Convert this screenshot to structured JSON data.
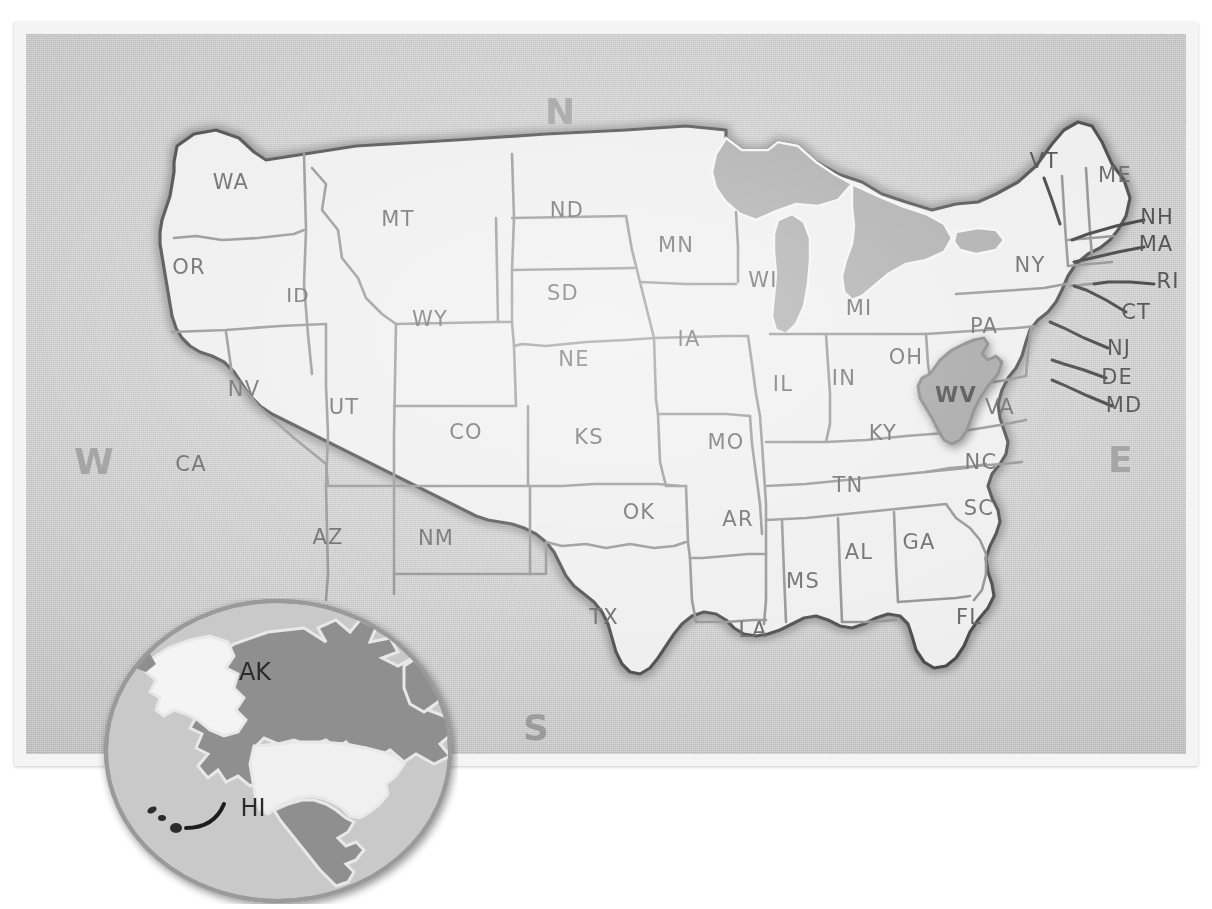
{
  "map": {
    "title": "United States map with West Virginia highlighted",
    "style": "hand-drawn poster on noisy gray board",
    "colors": {
      "board": "#c0c0c0",
      "frame": "#f4f4f4",
      "land_fill": "#ebebeb",
      "highlight_fill": "#8f8f8f",
      "water_fill": "#9a9a9a",
      "state_border": "#7d7d7d",
      "country_outline": "#2b2b2b",
      "label_text": "#4a4a4a",
      "compass_text": "#8d8d8d"
    },
    "highlighted_state": "WV"
  },
  "compass": {
    "north": "N",
    "south": "S",
    "east": "E",
    "west": "W"
  },
  "states": [
    {
      "code": "WA",
      "x": 205,
      "y": 155,
      "size": 21
    },
    {
      "code": "OR",
      "x": 163,
      "y": 240,
      "size": 21
    },
    {
      "code": "ID",
      "x": 272,
      "y": 268,
      "size": 20
    },
    {
      "code": "MT",
      "x": 372,
      "y": 192,
      "size": 21
    },
    {
      "code": "WY",
      "x": 404,
      "y": 292,
      "size": 21
    },
    {
      "code": "NV",
      "x": 218,
      "y": 362,
      "size": 21
    },
    {
      "code": "UT",
      "x": 318,
      "y": 380,
      "size": 21
    },
    {
      "code": "CA",
      "x": 165,
      "y": 437,
      "size": 21
    },
    {
      "code": "AZ",
      "x": 302,
      "y": 510,
      "size": 21
    },
    {
      "code": "NM",
      "x": 410,
      "y": 511,
      "size": 21
    },
    {
      "code": "CO",
      "x": 440,
      "y": 405,
      "size": 21
    },
    {
      "code": "ND",
      "x": 541,
      "y": 183,
      "size": 21
    },
    {
      "code": "SD",
      "x": 537,
      "y": 266,
      "size": 21
    },
    {
      "code": "NE",
      "x": 548,
      "y": 332,
      "size": 21
    },
    {
      "code": "KS",
      "x": 563,
      "y": 410,
      "size": 21
    },
    {
      "code": "OK",
      "x": 613,
      "y": 485,
      "size": 21
    },
    {
      "code": "TX",
      "x": 578,
      "y": 590,
      "size": 21
    },
    {
      "code": "MN",
      "x": 650,
      "y": 218,
      "size": 21
    },
    {
      "code": "IA",
      "x": 663,
      "y": 312,
      "size": 21
    },
    {
      "code": "MO",
      "x": 700,
      "y": 415,
      "size": 21
    },
    {
      "code": "AR",
      "x": 712,
      "y": 492,
      "size": 21
    },
    {
      "code": "LA",
      "x": 727,
      "y": 603,
      "size": 21
    },
    {
      "code": "WI",
      "x": 737,
      "y": 253,
      "size": 21
    },
    {
      "code": "IL",
      "x": 757,
      "y": 357,
      "size": 21
    },
    {
      "code": "MI",
      "x": 833,
      "y": 281,
      "size": 21
    },
    {
      "code": "IN",
      "x": 818,
      "y": 351,
      "size": 21
    },
    {
      "code": "OH",
      "x": 880,
      "y": 330,
      "size": 21
    },
    {
      "code": "KY",
      "x": 857,
      "y": 406,
      "size": 21
    },
    {
      "code": "TN",
      "x": 822,
      "y": 458,
      "size": 21
    },
    {
      "code": "MS",
      "x": 777,
      "y": 554,
      "size": 21
    },
    {
      "code": "AL",
      "x": 833,
      "y": 525,
      "size": 21
    },
    {
      "code": "GA",
      "x": 893,
      "y": 515,
      "size": 21
    },
    {
      "code": "FL",
      "x": 943,
      "y": 590,
      "size": 21
    },
    {
      "code": "SC",
      "x": 953,
      "y": 481,
      "size": 21
    },
    {
      "code": "NC",
      "x": 955,
      "y": 435,
      "size": 21
    },
    {
      "code": "VA",
      "x": 974,
      "y": 380,
      "size": 21
    },
    {
      "code": "WV",
      "x": 930,
      "y": 368,
      "size": 21,
      "highlighted": true
    },
    {
      "code": "PA",
      "x": 958,
      "y": 299,
      "size": 21
    },
    {
      "code": "NY",
      "x": 1004,
      "y": 238,
      "size": 21
    },
    {
      "code": "ME",
      "x": 1089,
      "y": 148,
      "size": 21
    }
  ],
  "leader_labels": [
    {
      "code": "VT",
      "x": 1018,
      "y": 134,
      "size": 21
    },
    {
      "code": "NH",
      "x": 1131,
      "y": 190,
      "size": 21
    },
    {
      "code": "MA",
      "x": 1130,
      "y": 217,
      "size": 21
    },
    {
      "code": "RI",
      "x": 1142,
      "y": 254,
      "size": 21
    },
    {
      "code": "CT",
      "x": 1110,
      "y": 285,
      "size": 21
    },
    {
      "code": "NJ",
      "x": 1093,
      "y": 321,
      "size": 21
    },
    {
      "code": "DE",
      "x": 1091,
      "y": 350,
      "size": 21
    },
    {
      "code": "MD",
      "x": 1098,
      "y": 378,
      "size": 21
    }
  ],
  "inset": {
    "name": "north-america-globe",
    "labels": [
      {
        "code": "AK",
        "x": 157,
        "y": 82,
        "size": 24
      },
      {
        "code": "HI",
        "x": 155,
        "y": 218,
        "size": 24
      }
    ]
  }
}
